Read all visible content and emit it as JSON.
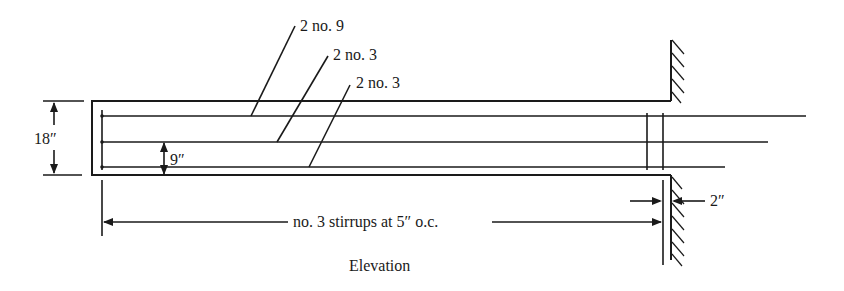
{
  "diagram": {
    "type": "reinforced concrete beam elevation",
    "caption": "Elevation",
    "labels": {
      "top_bars": "2 no. 9",
      "middle_bars": "2 no. 3",
      "bottom_bars": "2 no. 3",
      "depth_dimension": "18″",
      "half_depth_dimension": "9″",
      "cover_dimension": "2″",
      "stirrups": "no. 3 stirrups at 5″ o.c."
    },
    "colors": {
      "line": "#1a1a1a",
      "background": "#ffffff"
    }
  }
}
